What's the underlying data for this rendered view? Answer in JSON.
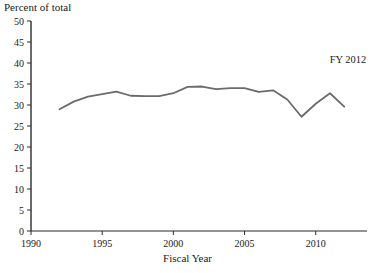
{
  "chart_data": {
    "type": "line",
    "title": "",
    "xlabel": "Fiscal Year",
    "ylabel": "Percent of total",
    "ylabel_position": "top-left",
    "grid": false,
    "legend": false,
    "annotations": [
      {
        "text": "FY 2012",
        "x": 2011.4,
        "y": 40.5
      }
    ],
    "xlim": [
      1990,
      2013.6
    ],
    "ylim": [
      0,
      50
    ],
    "xticks": [
      1990,
      1995,
      2000,
      2005,
      2010
    ],
    "xtick_labels": [
      "1990",
      "1995",
      "2000",
      "2005",
      "2010"
    ],
    "yticks": [
      0,
      5,
      10,
      15,
      20,
      25,
      30,
      35,
      40,
      45,
      50
    ],
    "ytick_labels": [
      "0",
      "5",
      "10",
      "15",
      "20",
      "25",
      "30",
      "35",
      "40",
      "45",
      "50"
    ],
    "line_color": "#6b6b6b",
    "line_width": 1.8,
    "series": [
      {
        "name": "Percent of total",
        "x": [
          1992,
          1993,
          1994,
          1995,
          1996,
          1997,
          1998,
          1999,
          2000,
          2001,
          2002,
          2003,
          2004,
          2005,
          2006,
          2007,
          2008,
          2009,
          2010,
          2011,
          2012
        ],
        "values": [
          29.0,
          30.8,
          32.0,
          32.6,
          33.2,
          32.2,
          32.1,
          32.1,
          32.8,
          34.3,
          34.4,
          33.8,
          34.0,
          34.0,
          33.1,
          33.5,
          31.3,
          27.2,
          30.3,
          32.8,
          29.6
        ]
      }
    ]
  }
}
